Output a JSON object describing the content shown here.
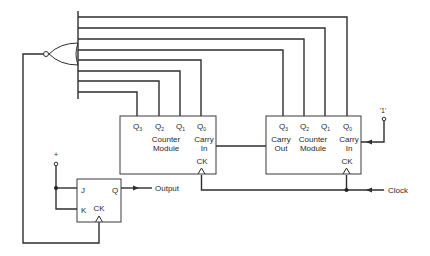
{
  "diagram": {
    "type": "digital-logic-schematic",
    "colors": {
      "line": "#2e2e2e",
      "background": "#ffffff",
      "text": "#2a2a2a"
    },
    "gate": {
      "kind": "NOR",
      "inputs": 8
    },
    "counter_left": {
      "outputs": [
        {
          "main": "Q",
          "sub": "3"
        },
        {
          "main": "Q",
          "sub": "2"
        },
        {
          "main": "Q",
          "sub": "1"
        },
        {
          "main": "Q",
          "sub": "0"
        }
      ],
      "title_line1": "Counter",
      "title_line2": "Module",
      "carry_in_line1": "Carry",
      "carry_in_line2": "In",
      "clock_label": "CK"
    },
    "counter_right": {
      "outputs": [
        {
          "main": "Q",
          "sub": "3"
        },
        {
          "main": "Q",
          "sub": "2"
        },
        {
          "main": "Q",
          "sub": "1"
        },
        {
          "main": "Q",
          "sub": "0"
        }
      ],
      "carry_out_line1": "Carry",
      "carry_out_line2": "Out",
      "title_line1": "Counter",
      "title_line2": "Module",
      "carry_in_line1": "Carry",
      "carry_in_line2": "In",
      "clock_label": "CK"
    },
    "flipflop": {
      "j_label": "J",
      "k_label": "K",
      "q_label": "Q",
      "clock_label": "CK"
    },
    "signals": {
      "logic_one": "'1'",
      "plus": "+",
      "output": "Output",
      "clock": "Clock"
    }
  }
}
